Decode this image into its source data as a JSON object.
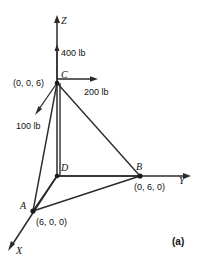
{
  "figure": {
    "part_label": "(a)",
    "axes": [
      {
        "name": "z-axis",
        "label": "Z"
      },
      {
        "name": "y-axis",
        "label": "Y"
      },
      {
        "name": "x-axis",
        "label": "X"
      }
    ],
    "points": [
      {
        "id": "C",
        "label": "C",
        "coord_label": "(0, 0, 6)"
      },
      {
        "id": "B",
        "label": "B",
        "coord_label": "(0, 6, 0)"
      },
      {
        "id": "A",
        "label": "A",
        "coord_label": "(6, 0, 0)"
      },
      {
        "id": "D",
        "label": "D",
        "coord_label": ""
      }
    ],
    "forces": [
      {
        "id": "force-400",
        "label": "400 lb",
        "direction": "up-along-z"
      },
      {
        "id": "force-200",
        "label": "200 lb",
        "direction": "right-along-y"
      },
      {
        "id": "force-100",
        "label": "100 lb",
        "direction": "down-left-toward-x"
      }
    ],
    "colors": {
      "line": "#2b2b2b",
      "text": "#111111",
      "background": "#ffffff"
    }
  }
}
